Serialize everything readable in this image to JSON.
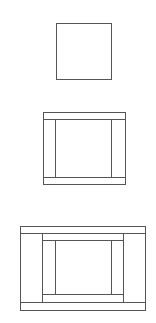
{
  "diagram": {
    "stroke_color": "#555555",
    "background": "#ffffff",
    "figures": [
      {
        "name": "stage-1-square",
        "rects": [
          {
            "x": 56,
            "y": 23,
            "w": 55,
            "h": 56
          }
        ],
        "lines": []
      },
      {
        "name": "stage-2-framed-square",
        "rects": [
          {
            "x": 43,
            "y": 112,
            "w": 82,
            "h": 72
          }
        ],
        "lines": [
          {
            "x1": 43,
            "y1": 119,
            "x2": 125,
            "y2": 119
          },
          {
            "x1": 43,
            "y1": 177,
            "x2": 125,
            "y2": 177
          },
          {
            "x1": 55,
            "y1": 119,
            "x2": 55,
            "y2": 177
          },
          {
            "x1": 111,
            "y1": 119,
            "x2": 111,
            "y2": 177
          }
        ]
      },
      {
        "name": "stage-3-double-framed-square",
        "rects": [
          {
            "x": 20,
            "y": 226,
            "w": 125,
            "h": 84
          }
        ],
        "lines": [
          {
            "x1": 20,
            "y1": 233,
            "x2": 145,
            "y2": 233
          },
          {
            "x1": 20,
            "y1": 302,
            "x2": 145,
            "y2": 302
          },
          {
            "x1": 42,
            "y1": 233,
            "x2": 42,
            "y2": 302
          },
          {
            "x1": 123,
            "y1": 233,
            "x2": 123,
            "y2": 302
          },
          {
            "x1": 42,
            "y1": 240,
            "x2": 123,
            "y2": 240
          },
          {
            "x1": 42,
            "y1": 294,
            "x2": 123,
            "y2": 294
          },
          {
            "x1": 55,
            "y1": 240,
            "x2": 55,
            "y2": 294
          },
          {
            "x1": 111,
            "y1": 240,
            "x2": 111,
            "y2": 294
          }
        ]
      }
    ]
  }
}
